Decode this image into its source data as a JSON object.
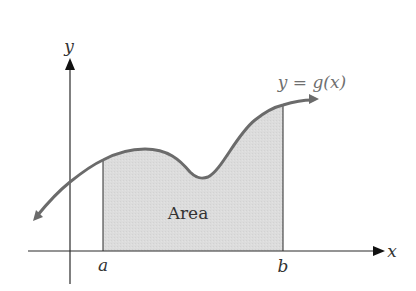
{
  "diagram": {
    "axes": {
      "x_label": "x",
      "y_label": "y"
    },
    "curve": {
      "label": "y = g(x)",
      "color": "#6b6b6b"
    },
    "bounds": {
      "lower": "a",
      "upper": "b"
    },
    "region": {
      "label": "Area",
      "fill_color": "#d9d9d9"
    },
    "colors": {
      "axis": "#2a2a2a",
      "text": "#333333",
      "curve_label": "#6f6f6f"
    }
  }
}
